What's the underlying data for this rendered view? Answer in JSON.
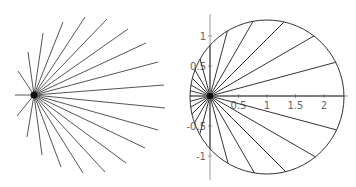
{
  "left_plot": {
    "center": [
      34,
      95
    ],
    "line_color": "#555555",
    "endpoints": [
      [
        15,
        95
      ],
      [
        17,
        116
      ],
      [
        27,
        137
      ],
      [
        42,
        155
      ],
      [
        61,
        167
      ],
      [
        83,
        173
      ],
      [
        105,
        172
      ],
      [
        126,
        163
      ],
      [
        145,
        148
      ],
      [
        158,
        130
      ],
      [
        165,
        108
      ],
      [
        164,
        85
      ],
      [
        158,
        62
      ],
      [
        146,
        43
      ],
      [
        128,
        29
      ],
      [
        107,
        19
      ],
      [
        85,
        17
      ],
      [
        63,
        22
      ],
      [
        43,
        33
      ],
      [
        28,
        52
      ],
      [
        18,
        71
      ]
    ]
  },
  "right_plot": {
    "origin": [
      210,
      96
    ],
    "px_per_unit_x": 57,
    "px_per_unit_y": 60,
    "circle": {
      "cx": 267,
      "cy": 97,
      "r": 77
    },
    "ray_count": 24,
    "line_color": "#333333",
    "axis_color": "#999999",
    "x_ticks": [
      {
        "v": 0.5,
        "label": "0.5"
      },
      {
        "v": 1,
        "label": "1"
      },
      {
        "v": 1.5,
        "label": "1.5"
      },
      {
        "v": 2,
        "label": "2"
      }
    ],
    "y_ticks": [
      {
        "v": 1,
        "label": "1"
      },
      {
        "v": 0.5,
        "label": "0.5"
      },
      {
        "v": -0.5,
        "label": "-0.5"
      },
      {
        "v": -1,
        "label": "-1"
      }
    ]
  }
}
